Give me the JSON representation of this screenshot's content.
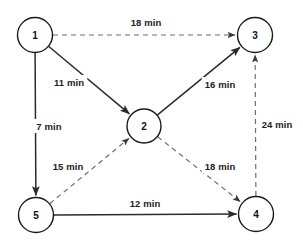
{
  "diagram": {
    "background_color": "#ffffff",
    "solid_edge_color": "#2b2b2b",
    "dashed_edge_color": "#6d6d6d",
    "node_stroke_color": "#1a1a1a",
    "label_color": "#222222"
  },
  "nodes": [
    {
      "id": "1",
      "label": "1",
      "cx": 35,
      "cy": 35,
      "r": 17.5
    },
    {
      "id": "2",
      "label": "2",
      "cx": 144,
      "cy": 126,
      "r": 17
    },
    {
      "id": "3",
      "label": "3",
      "cx": 255,
      "cy": 35,
      "r": 17.5
    },
    {
      "id": "4",
      "label": "4",
      "cx": 256,
      "cy": 214,
      "r": 17.5
    },
    {
      "id": "5",
      "label": "5",
      "cx": 36,
      "cy": 215,
      "r": 17.5
    }
  ],
  "edges": [
    {
      "id": "e1-3",
      "from": "1",
      "to": "3",
      "label": "18 min",
      "weight": 18,
      "unit": "min",
      "style": "dashed",
      "label_x": 146,
      "label_y": 22
    },
    {
      "id": "e1-2",
      "from": "1",
      "to": "2",
      "label": "11 min",
      "weight": 11,
      "unit": "min",
      "style": "solid",
      "label_x": 69,
      "label_y": 82
    },
    {
      "id": "e1-5",
      "from": "1",
      "to": "5",
      "label": "7 min",
      "weight": 7,
      "unit": "min",
      "style": "solid",
      "label_x": 49,
      "label_y": 126
    },
    {
      "id": "e2-3",
      "from": "2",
      "to": "3",
      "label": "16 min",
      "weight": 16,
      "unit": "min",
      "style": "solid",
      "label_x": 220,
      "label_y": 84
    },
    {
      "id": "e4-3",
      "from": "4",
      "to": "3",
      "label": "24 min",
      "weight": 24,
      "unit": "min",
      "style": "dashed",
      "label_x": 277,
      "label_y": 124
    },
    {
      "id": "e5-2",
      "from": "5",
      "to": "2",
      "label": "15 min",
      "weight": 15,
      "unit": "min",
      "style": "dashed",
      "label_x": 68,
      "label_y": 166
    },
    {
      "id": "e2-4",
      "from": "2",
      "to": "4",
      "label": "18 min",
      "weight": 18,
      "unit": "min",
      "style": "dashed",
      "label_x": 220,
      "label_y": 166
    },
    {
      "id": "e5-4",
      "from": "5",
      "to": "4",
      "label": "12 min",
      "weight": 12,
      "unit": "min",
      "style": "solid",
      "label_x": 145,
      "label_y": 203
    }
  ]
}
